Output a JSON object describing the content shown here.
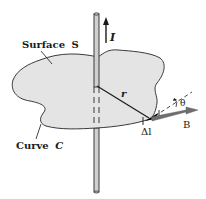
{
  "figure": {
    "labels": {
      "surface": "Surface",
      "surface_symbol": "S",
      "curve": "Curve",
      "curve_symbol": "C",
      "current": "I",
      "radius": "r",
      "angle": "θ",
      "delta_l": "Δl",
      "field": "B"
    },
    "colors": {
      "surface_fill": "#e6e6e6",
      "outline": "#333333",
      "wire_fill": "#cfcfcf",
      "field_arrow": "#6e6e6e",
      "background": "#ffffff"
    }
  }
}
